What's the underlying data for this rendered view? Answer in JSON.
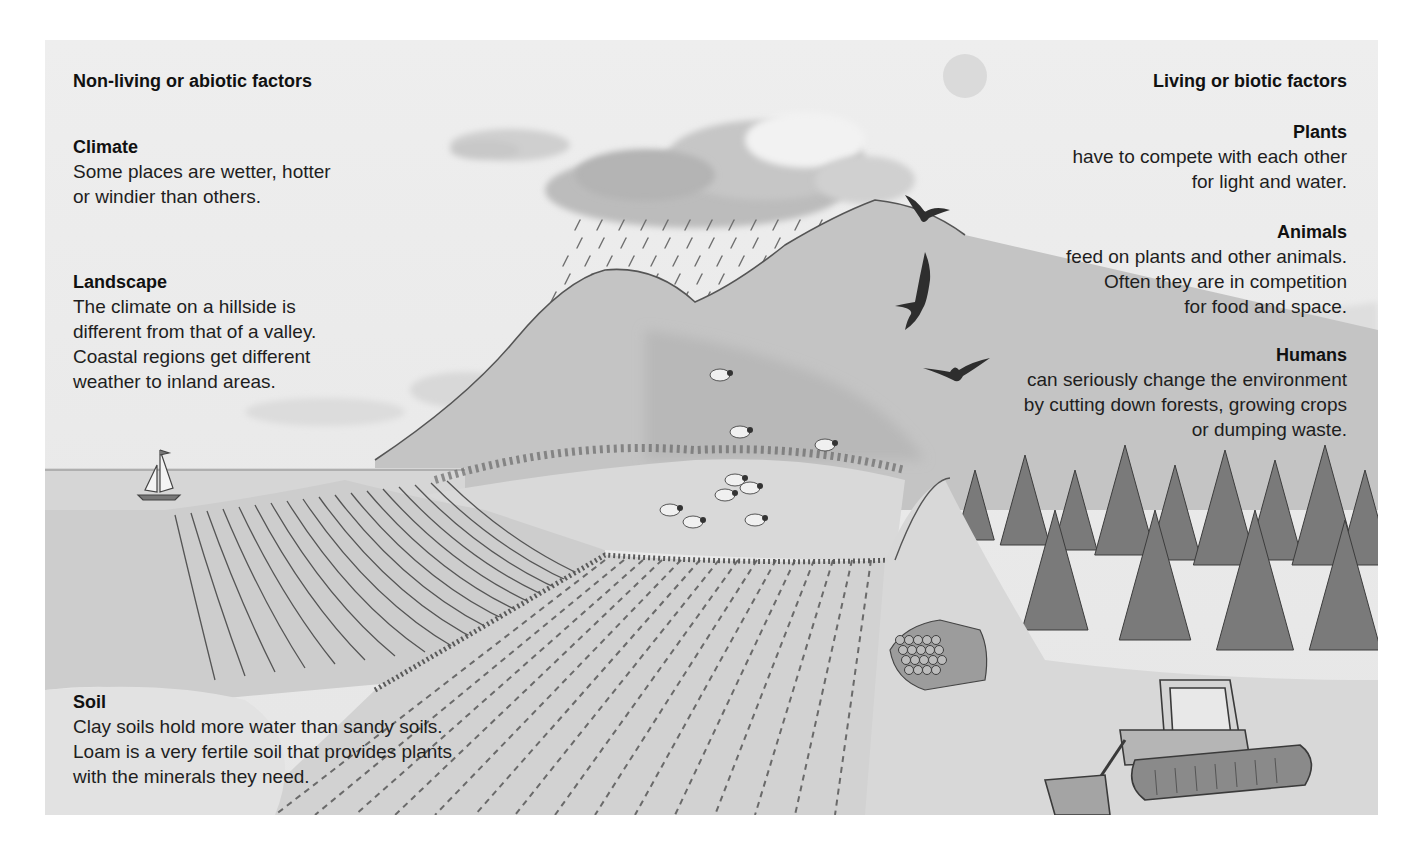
{
  "abiotic": {
    "heading": "Non-living or abiotic factors",
    "factors": [
      {
        "title": "Climate",
        "lines": [
          "Some places are wetter, hotter",
          "or windier than others."
        ]
      },
      {
        "title": "Landscape",
        "lines": [
          "The climate on a hillside is",
          "different from that of a valley.",
          "Coastal regions get different",
          "weather to inland areas."
        ]
      },
      {
        "title": "Soil",
        "lines": [
          "Clay soils hold more water than sandy soils.",
          "Loam is a very fertile soil that provides plants",
          "with the minerals they need."
        ]
      }
    ]
  },
  "biotic": {
    "heading": "Living or biotic factors",
    "factors": [
      {
        "title": "Plants",
        "lines": [
          "have to compete with each other",
          "for light and water."
        ]
      },
      {
        "title": "Animals",
        "lines": [
          "feed on plants and other animals.",
          "Often they are in competition",
          "for food and space."
        ]
      },
      {
        "title": "Humans",
        "lines": [
          "can seriously change the environment",
          "by cutting down forests, growing crops",
          "or dumping waste."
        ]
      }
    ]
  },
  "illustration": {
    "elements": [
      "sun",
      "rain-cloud",
      "rain",
      "hills",
      "birds",
      "sea",
      "sailboat",
      "ploughed-field",
      "crop-field",
      "sheep",
      "pine-forest",
      "log-pile",
      "bulldozer"
    ],
    "colors": {
      "paper": "#ebebeb",
      "page": "#ffffff",
      "ink": "#1e1e1e"
    }
  }
}
